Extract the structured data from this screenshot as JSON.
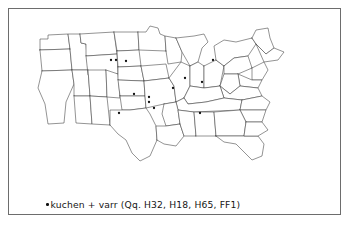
{
  "figure": {
    "kind": "dialect-distribution-map",
    "region_depicted": "United States",
    "frame_color": "#6d6d6d",
    "outline_color": "#3b3b3b",
    "dot_color": "#101010",
    "background_color": "#ffffff"
  },
  "caption": {
    "bullet_symbol": "•",
    "text": "kuchen + varr  (Qq. H32, H18, H65, FF1)",
    "headword": "kuchen",
    "operator": "+",
    "variant_label": "varr",
    "question_prefix": "Qq.",
    "question_numbers": [
      "H32",
      "H18",
      "H65",
      "FF1"
    ]
  },
  "chart_data": {
    "type": "scatter",
    "title": "kuchen + varr  (Qq. H32, H18, H65, FF1)",
    "xlabel": "",
    "ylabel": "",
    "grid": false,
    "legend_position": "bottom-left",
    "xlim": [
      0,
      331
    ],
    "ylim": [
      0,
      170
    ],
    "series": [
      {
        "name": "kuchen + varr",
        "marker": "dot",
        "color": "#101010",
        "points": [
          {
            "x": 93,
            "y": 42
          },
          {
            "x": 98,
            "y": 42
          },
          {
            "x": 108,
            "y": 43
          },
          {
            "x": 195,
            "y": 42
          },
          {
            "x": 167,
            "y": 60
          },
          {
            "x": 184,
            "y": 64
          },
          {
            "x": 155,
            "y": 70
          },
          {
            "x": 116,
            "y": 76
          },
          {
            "x": 131,
            "y": 79
          },
          {
            "x": 131,
            "y": 84
          },
          {
            "x": 136,
            "y": 90
          },
          {
            "x": 101,
            "y": 95
          },
          {
            "x": 182,
            "y": 95
          }
        ]
      }
    ]
  },
  "map_dots": [
    {
      "id": "d1",
      "cx": 93,
      "cy": 42
    },
    {
      "id": "d2",
      "cx": 98,
      "cy": 42
    },
    {
      "id": "d3",
      "cx": 108,
      "cy": 43
    },
    {
      "id": "d4",
      "cx": 195,
      "cy": 42
    },
    {
      "id": "d5",
      "cx": 167,
      "cy": 60
    },
    {
      "id": "d6",
      "cx": 184,
      "cy": 64
    },
    {
      "id": "d7",
      "cx": 155,
      "cy": 70
    },
    {
      "id": "d8",
      "cx": 116,
      "cy": 76
    },
    {
      "id": "d9",
      "cx": 131,
      "cy": 79
    },
    {
      "id": "d10",
      "cx": 131,
      "cy": 84
    },
    {
      "id": "d11",
      "cx": 136,
      "cy": 90
    },
    {
      "id": "d12",
      "cx": 101,
      "cy": 95
    },
    {
      "id": "d13",
      "cx": 182,
      "cy": 95
    }
  ]
}
